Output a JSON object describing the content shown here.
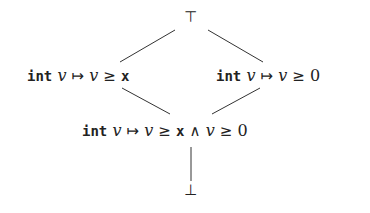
{
  "diagram": {
    "type": "lattice",
    "top": {
      "label": "⊤"
    },
    "left": {
      "kw": "int",
      "var": "v",
      "maps": "↦",
      "lhs": "v",
      "rel": "≥",
      "rhs": "x"
    },
    "right": {
      "kw": "int",
      "var": "v",
      "maps": "↦",
      "lhs": "v",
      "rel": "≥",
      "rhs": "0"
    },
    "meet": {
      "kw": "int",
      "var": "v",
      "maps": "↦",
      "lhs": "v",
      "rel": "≥",
      "rhs": "x",
      "and": "∧",
      "lhs2": "v",
      "rel2": "≥",
      "rhs2": "0"
    },
    "bottom": {
      "label": "⊥"
    },
    "edge_color": "#333333"
  }
}
